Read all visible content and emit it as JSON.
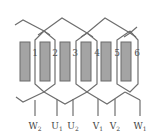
{
  "diagram": {
    "type": "three-phase winding diagram",
    "colors": {
      "wire": "#6e6e6e",
      "slot_fill": "#a4a4a4",
      "slot_border": "#6a6a6a",
      "text": "#444444"
    },
    "slots": [
      {
        "num": "1"
      },
      {
        "num": "2"
      },
      {
        "num": "3"
      },
      {
        "num": "4"
      },
      {
        "num": "5"
      },
      {
        "num": "6"
      }
    ],
    "terminals": [
      {
        "letter": "W",
        "sub": "2"
      },
      {
        "letter": "U",
        "sub": "1"
      },
      {
        "letter": "U",
        "sub": "2"
      },
      {
        "letter": "V",
        "sub": "1"
      },
      {
        "letter": "V",
        "sub": "2"
      },
      {
        "letter": "W",
        "sub": "1"
      }
    ]
  }
}
